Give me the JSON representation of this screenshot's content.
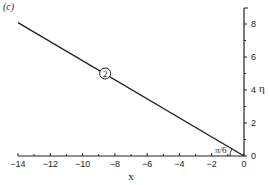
{
  "panel_label": "(c)",
  "chart_data": {
    "type": "line",
    "title": "",
    "panel": "(c)",
    "xlabel": "x",
    "ylabel": "η",
    "xlim": [
      -14,
      0
    ],
    "ylim": [
      0,
      9
    ],
    "grid": false,
    "legend": null,
    "x_ticks": [
      -14,
      -12,
      -10,
      -8,
      -6,
      -4,
      -2,
      0
    ],
    "x_tick_labels": [
      "−14",
      "−12",
      "−10",
      "−8",
      "−6",
      "−4",
      "−2",
      "0"
    ],
    "y_ticks": [
      0,
      2,
      4,
      6,
      8
    ],
    "y_tick_labels": [
      "0",
      "2",
      "4",
      "6",
      "8"
    ],
    "series": [
      {
        "name": "line 2",
        "x": [
          -14,
          0
        ],
        "y": [
          8.08,
          0
        ],
        "color": "#222222"
      }
    ],
    "annotations": [
      {
        "text": "2",
        "style": "circled",
        "x": -8.6,
        "y": 5.0
      },
      {
        "text": "π/6",
        "type": "angle",
        "x": -0.9,
        "y": 0.3
      }
    ]
  },
  "colors": {
    "ink": "#222222",
    "background": "#ffffff"
  }
}
